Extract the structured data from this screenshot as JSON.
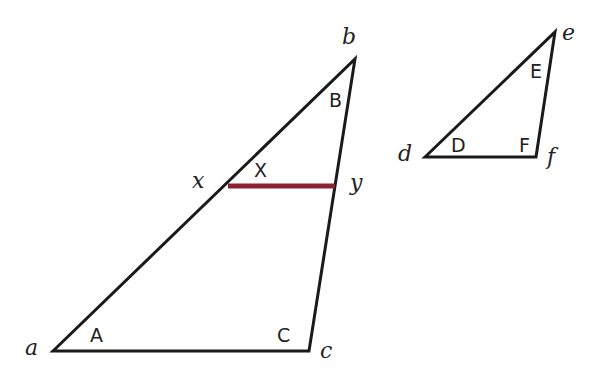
{
  "diagram": {
    "colors": {
      "line": "#1a1a1a",
      "segment": "#8b2332",
      "background": "#ffffff"
    },
    "large_triangle": {
      "vertices": {
        "a": "a",
        "b": "b",
        "c": "c"
      },
      "angles": {
        "A": "A",
        "B": "B",
        "C": "C"
      }
    },
    "segment": {
      "endpoints": {
        "x": "x",
        "y": "y"
      },
      "angle": "X"
    },
    "small_triangle": {
      "vertices": {
        "d": "d",
        "e": "e",
        "f": "f"
      },
      "angles": {
        "D": "D",
        "E": "E",
        "F": "F"
      }
    }
  }
}
